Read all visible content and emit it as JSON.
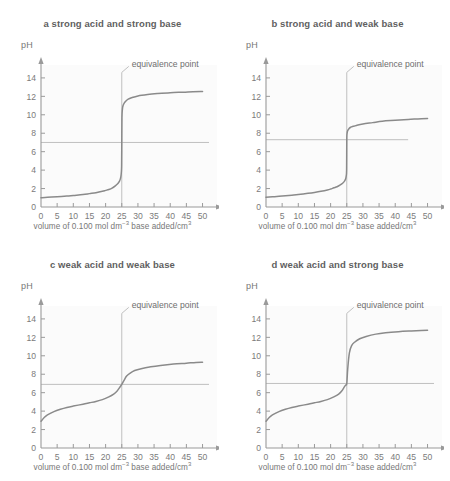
{
  "figure": {
    "title": "",
    "background_color": "#ffffff",
    "plot_background_color": "#fbfbfb",
    "curve_color": "#8a8a8a",
    "axis_color": "#9a9a9a",
    "guide_color": "#b9b9b9",
    "text_color": "#6e6e6e"
  },
  "axes": {
    "ylabel": "pH",
    "xlabel_prefix": "volume of 0.100 mol dm",
    "xlabel_sup1": "−3",
    "xlabel_mid": " base added/cm",
    "xlabel_sup2": "3",
    "xticks": [
      "0",
      "5",
      "10",
      "15",
      "20",
      "25",
      "30",
      "35",
      "40",
      "45",
      "50"
    ],
    "yticks": [
      "0",
      "2",
      "4",
      "6",
      "8",
      "10",
      "12",
      "14"
    ],
    "xlim": [
      0,
      52
    ],
    "ylim": [
      0,
      15.4
    ],
    "annotation": "equivalence point"
  },
  "chart_data": [
    {
      "type": "line",
      "panel": "a",
      "title": "a strong acid and strong base",
      "xlabel": "volume of 0.100 mol dm−3 base added/cm3",
      "ylabel": "pH",
      "xlim": [
        0,
        52
      ],
      "ylim": [
        0,
        15.4
      ],
      "grid": false,
      "legend": "none",
      "equivalence_point": {
        "x": 25,
        "ph": 7,
        "label": "equivalence point"
      },
      "ph7_line": {
        "ph": 7,
        "x_start": 0,
        "x_end": 52
      },
      "x": [
        0,
        2,
        5,
        8,
        10,
        13,
        15,
        17,
        19,
        20,
        21,
        22,
        23,
        23.8,
        24.3,
        24.6,
        24.8,
        24.95,
        25,
        25.05,
        25.2,
        25.4,
        25.8,
        26.3,
        27,
        28,
        30,
        33,
        36,
        40,
        44,
        47,
        50
      ],
      "y": [
        1.0,
        1.05,
        1.1,
        1.18,
        1.25,
        1.35,
        1.45,
        1.55,
        1.7,
        1.8,
        1.9,
        2.05,
        2.3,
        2.55,
        2.8,
        3.1,
        3.5,
        4.4,
        7.0,
        9.7,
        10.6,
        11.0,
        11.3,
        11.5,
        11.7,
        11.85,
        12.05,
        12.2,
        12.3,
        12.4,
        12.45,
        12.5,
        12.52
      ]
    },
    {
      "type": "line",
      "panel": "b",
      "title": "b strong acid and weak base",
      "xlabel": "volume of 0.100 mol dm−3 base added/cm3",
      "ylabel": "pH",
      "xlim": [
        0,
        52
      ],
      "ylim": [
        0,
        15.4
      ],
      "grid": false,
      "legend": "none",
      "equivalence_point": {
        "x": 25,
        "ph": 7.3,
        "label": "equivalence point"
      },
      "ph7_line": {
        "ph": 7.3,
        "x_start": 0,
        "x_end": 44
      },
      "x": [
        0,
        2,
        5,
        8,
        10,
        13,
        15,
        17,
        19,
        20,
        21,
        22,
        23,
        23.8,
        24.3,
        24.6,
        24.8,
        24.95,
        25,
        25.1,
        25.3,
        25.7,
        26.2,
        27,
        28,
        30,
        33,
        36,
        40,
        44,
        47,
        50
      ],
      "y": [
        1.05,
        1.1,
        1.18,
        1.28,
        1.35,
        1.48,
        1.58,
        1.7,
        1.85,
        1.95,
        2.08,
        2.2,
        2.4,
        2.6,
        2.8,
        3.0,
        3.3,
        4.0,
        7.3,
        8.0,
        8.3,
        8.5,
        8.65,
        8.75,
        8.85,
        9.0,
        9.15,
        9.3,
        9.4,
        9.5,
        9.55,
        9.6
      ]
    },
    {
      "type": "line",
      "panel": "c",
      "title": "c weak acid and weak base",
      "xlabel": "volume of 0.100 mol dm−3 base added/cm3",
      "ylabel": "pH",
      "xlim": [
        0,
        52
      ],
      "ylim": [
        0,
        15.4
      ],
      "grid": false,
      "legend": "none",
      "equivalence_point": {
        "x": 25,
        "ph": 6.9,
        "label": "equivalence point"
      },
      "ph7_line": {
        "ph": 6.9,
        "x_start": 0,
        "x_end": 52
      },
      "x": [
        0,
        1,
        2,
        4,
        6,
        8,
        10,
        13,
        15,
        17,
        19,
        21,
        22.5,
        23.5,
        24.2,
        25,
        25.8,
        26.5,
        27.5,
        29,
        31,
        34,
        37,
        41,
        45,
        48,
        50
      ],
      "y": [
        2.9,
        3.3,
        3.6,
        3.95,
        4.2,
        4.4,
        4.55,
        4.75,
        4.9,
        5.05,
        5.25,
        5.55,
        5.85,
        6.15,
        6.5,
        6.9,
        7.4,
        7.8,
        8.1,
        8.4,
        8.6,
        8.8,
        8.95,
        9.1,
        9.2,
        9.28,
        9.3
      ]
    },
    {
      "type": "line",
      "panel": "d",
      "title": "d weak acid and strong base",
      "xlabel": "volume of 0.100 mol dm−3 base added/cm3",
      "ylabel": "pH",
      "xlim": [
        0,
        52
      ],
      "ylim": [
        0,
        15.4
      ],
      "grid": false,
      "legend": "none",
      "equivalence_point": {
        "x": 25,
        "ph": 7.0,
        "label": "equivalence point"
      },
      "ph7_line": {
        "ph": 7.0,
        "x_start": 0,
        "x_end": 52
      },
      "x": [
        0,
        1,
        2,
        4,
        6,
        8,
        10,
        13,
        15,
        17,
        19,
        21,
        22.5,
        23.5,
        24.2,
        24.7,
        25,
        25.3,
        25.8,
        26.5,
        27.5,
        29,
        31,
        34,
        37,
        41,
        45,
        48,
        50
      ],
      "y": [
        2.9,
        3.3,
        3.6,
        3.95,
        4.2,
        4.4,
        4.55,
        4.75,
        4.9,
        5.05,
        5.25,
        5.55,
        5.85,
        6.2,
        6.6,
        6.85,
        7.0,
        8.6,
        10.3,
        11.1,
        11.5,
        11.85,
        12.1,
        12.35,
        12.5,
        12.62,
        12.7,
        12.75,
        12.78
      ]
    }
  ]
}
